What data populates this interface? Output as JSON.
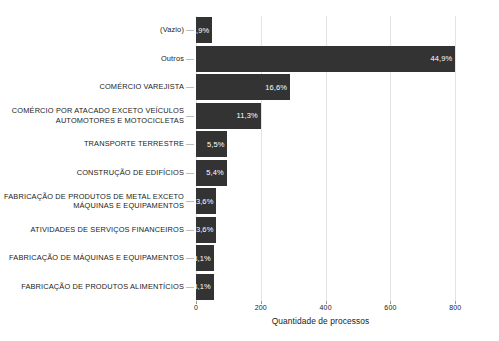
{
  "chart_data": {
    "type": "bar",
    "orientation": "horizontal",
    "title": "",
    "subtitle": "",
    "xlabel": "Quantidade de processos",
    "ylabel": "",
    "xlim": [
      0,
      870
    ],
    "xticks": [
      0,
      200,
      400,
      600,
      800
    ],
    "xticklabels": [
      "0",
      "200",
      "400",
      "600",
      "800"
    ],
    "grid": true,
    "grid_axis": "x",
    "legend": false,
    "bar_color": "#333333",
    "label_color": "#ffffff",
    "background": "#ffffff",
    "gridline_color": "#e3e3e3",
    "categories": [
      "(Vazio)",
      "Outros",
      "COMÉRCIO VAREJISTA",
      "COMÉRCIO POR ATACADO EXCETO VEÍCULOS\nAUTOMOTORES E MOTOCICLETAS",
      "TRANSPORTE TERRESTRE",
      "CONSTRUÇÃO DE EDIFÍCIOS",
      "FABRICAÇÃO DE PRODUTOS DE METAL EXCETO\nMÁQUINAS E EQUIPAMENTOS",
      "ATIVIDADES DE SERVIÇOS FINANCEIROS",
      "FABRICAÇÃO DE MÁQUINAS E EQUIPAMENTOS",
      "FABRICAÇÃO DE PRODUTOS ALIMENTÍCIOS"
    ],
    "values": [
      50,
      800,
      290,
      200,
      97,
      95,
      63,
      63,
      55,
      55
    ],
    "data_labels": [
      "2,9%",
      "44,9%",
      "16,6%",
      "11,3%",
      "5,5%",
      "5,4%",
      "3,6%",
      "3,6%",
      "3,1%",
      "3,1%"
    ],
    "percentages": [
      2.9,
      44.9,
      16.6,
      11.3,
      5.5,
      5.4,
      3.6,
      3.6,
      3.1,
      3.1
    ]
  },
  "axis": {
    "x_title": "Quantidade de processos"
  }
}
